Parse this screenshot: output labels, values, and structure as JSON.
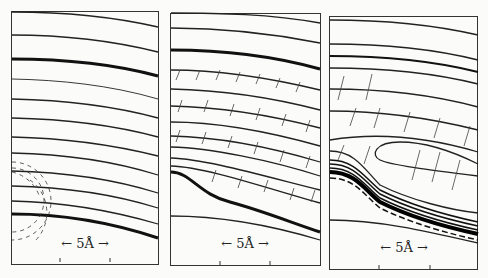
{
  "figure": {
    "panels": [
      {
        "id": "a",
        "scale_label": "← 5Å →",
        "description": "flat contour lines with dashed circular contours at lower left"
      },
      {
        "id": "b",
        "scale_label": "← 5Å →",
        "description": "contour lines with dashed field lines, dip at lower left"
      },
      {
        "id": "c",
        "scale_label": "← 5Å →",
        "description": "contour lines with dense band and closed lobe"
      }
    ]
  }
}
